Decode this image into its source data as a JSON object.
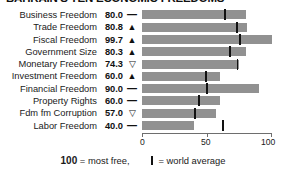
{
  "title": "BAHRAIN'S TEN ECONOMIC FREEDOMS",
  "colors": {
    "bar": "#919191",
    "average_mark": "#121212",
    "axis": "#6e6e6e",
    "text": "#1a1a1a",
    "background": "#ffffff"
  },
  "legend": {
    "max_value": "100",
    "max_text": "= most free,",
    "average_text": "= world average",
    "average_icon": "vertical-bar-icon"
  },
  "axis": {
    "min": 0,
    "max": 100,
    "ticks": [
      0,
      50,
      100
    ],
    "tick_labels": [
      "0",
      "50",
      "100"
    ]
  },
  "trend_glyphs": {
    "up": "▲",
    "down": "▽",
    "flat": "—"
  },
  "chart_data": {
    "type": "bar",
    "orientation": "horizontal",
    "title": "BAHRAIN'S TEN ECONOMIC FREEDOMS",
    "xlabel": "",
    "ylabel": "",
    "xlim": [
      0,
      100
    ],
    "grid": false,
    "legend_position": "bottom",
    "categories": [
      "Business Freedom",
      "Trade Freedom",
      "Fiscal Freedom",
      "Government Size",
      "Monetary Freedom",
      "Investment Freedom",
      "Financial Freedom",
      "Property Rights",
      "Fdm fm Corruption",
      "Labor Freedom"
    ],
    "values": [
      80.0,
      80.8,
      99.7,
      80.3,
      74.3,
      60.0,
      90.0,
      60.0,
      57.0,
      40.0
    ],
    "value_labels": [
      "80.0",
      "80.8",
      "99.7",
      "80.3",
      "74.3",
      "60.0",
      "90.0",
      "60.0",
      "57.0",
      "40.0"
    ],
    "trends": [
      "flat",
      "up",
      "up",
      "up",
      "down",
      "up",
      "flat",
      "flat",
      "down",
      "flat"
    ],
    "world_average": [
      64.0,
      73.0,
      75.5,
      68.0,
      73.5,
      49.5,
      50.0,
      44.0,
      40.5,
      62.0
    ],
    "series": [
      {
        "name": "Bahrain score",
        "values": [
          80.0,
          80.8,
          99.7,
          80.3,
          74.3,
          60.0,
          90.0,
          60.0,
          57.0,
          40.0
        ]
      },
      {
        "name": "World average",
        "values": [
          64.0,
          73.0,
          75.5,
          68.0,
          73.5,
          49.5,
          50.0,
          44.0,
          40.5,
          62.0
        ]
      }
    ]
  },
  "rows": [
    {
      "label": "Business Freedom",
      "value": "80.0",
      "trend": "flat",
      "score": 80.0,
      "avg": 64.0
    },
    {
      "label": "Trade Freedom",
      "value": "80.8",
      "trend": "up",
      "score": 80.8,
      "avg": 73.0
    },
    {
      "label": "Fiscal Freedom",
      "value": "99.7",
      "trend": "up",
      "score": 99.7,
      "avg": 75.5
    },
    {
      "label": "Government Size",
      "value": "80.3",
      "trend": "up",
      "score": 80.3,
      "avg": 68.0
    },
    {
      "label": "Monetary Freedom",
      "value": "74.3",
      "trend": "down",
      "score": 74.3,
      "avg": 73.5
    },
    {
      "label": "Investment Freedom",
      "value": "60.0",
      "trend": "up",
      "score": 60.0,
      "avg": 49.5
    },
    {
      "label": "Financial Freedom",
      "value": "90.0",
      "trend": "flat",
      "score": 90.0,
      "avg": 50.0
    },
    {
      "label": "Property Rights",
      "value": "60.0",
      "trend": "flat",
      "score": 60.0,
      "avg": 44.0
    },
    {
      "label": "Fdm fm Corruption",
      "value": "57.0",
      "trend": "down",
      "score": 57.0,
      "avg": 40.5
    },
    {
      "label": "Labor Freedom",
      "value": "40.0",
      "trend": "flat",
      "score": 40.0,
      "avg": 62.0
    }
  ]
}
